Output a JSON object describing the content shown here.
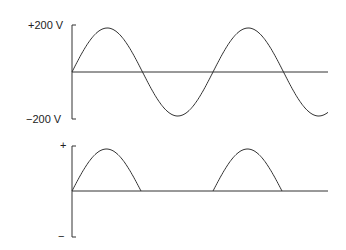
{
  "top_plot": {
    "label_max": "+200 V",
    "label_min": "−200 V",
    "description": "Full AC sine wave"
  },
  "bottom_plot": {
    "label_plus": "+",
    "label_minus": "−",
    "description": "Half-wave rectified output"
  },
  "colors": {
    "stroke": "#333333",
    "background": "#ffffff"
  }
}
